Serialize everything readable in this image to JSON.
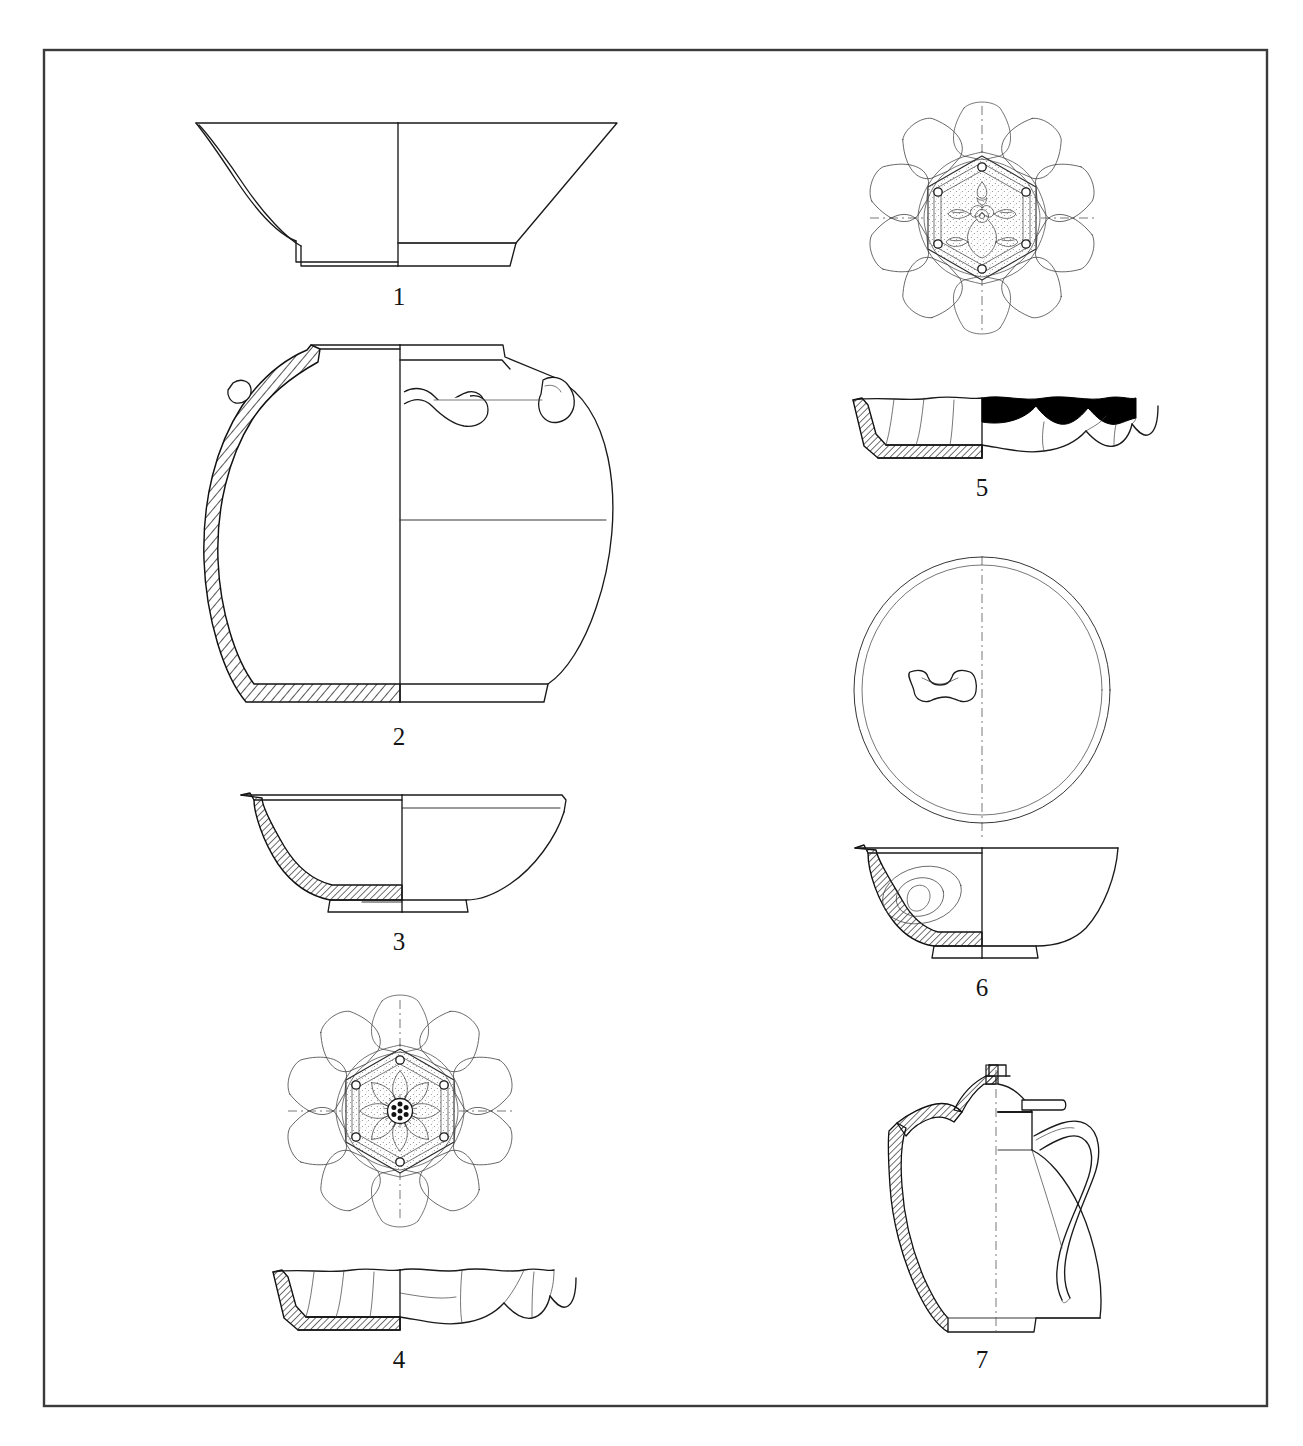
{
  "plate": {
    "type": "archaeological-vessel-illustration-plate",
    "description": "Line-drawing plate of seven ceramic vessels, each shown as a half-section (hatched, left) and half-elevation (outline, right); lobed dishes and one lid additionally shown in plan view above their profiles.",
    "border_color": "#3a3a3a",
    "background_color": "#ffffff",
    "ink_color": "#1a1a1a",
    "figure_count": 7
  },
  "figures": [
    {
      "number": "1",
      "name": "conical-bowl",
      "label": "1",
      "views": [
        "profile-section"
      ],
      "column": "left",
      "notes": "Deep conical bowl with flaring straight walls and a low ring foot; left half hatched in section."
    },
    {
      "number": "2",
      "name": "globular-jar-with-lugs",
      "label": "2",
      "views": [
        "profile-section"
      ],
      "column": "left",
      "notes": "Wide-mouthed globular jar with short everted rim and two loop lug handles on the shoulder."
    },
    {
      "number": "3",
      "name": "shallow-bowl",
      "label": "3",
      "views": [
        "profile-section"
      ],
      "column": "left",
      "notes": "Shallow rounded bowl with slightly everted rim and a low ring foot."
    },
    {
      "number": "4",
      "name": "lobed-lotus-dish-rosette",
      "label": "4",
      "views": [
        "plan",
        "profile-section"
      ],
      "column": "left",
      "notes": "Ten-lobed foliate dish; interior medallion of a hexagonal cartouche enclosing an eight-petal rosette with a seven-dot sunburst centre."
    },
    {
      "number": "5",
      "name": "lobed-lotus-dish-floral-spray",
      "label": "5",
      "views": [
        "plan",
        "profile-section"
      ],
      "column": "right",
      "notes": "Ten-lobed foliate dish; hexagonal cartouche enclosing a leafy floral spray with bud. Profile shows a solid black (dark glazed) band below the rim on the elevation half."
    },
    {
      "number": "6",
      "name": "bowl-with-lid",
      "label": "6",
      "views": [
        "plan",
        "profile-section"
      ],
      "column": "right",
      "notes": "Round lid in plan with a central spool-shaped lug; below, a hemispherical bowl with a ring foot and an oval medallion shown on the interior."
    },
    {
      "number": "7",
      "name": "lidded-ewer",
      "label": "7",
      "views": [
        "profile-section"
      ],
      "column": "right",
      "notes": "Pear-shaped ewer with a tall curving spout, domed lid with finial and lug, and a high strap handle."
    }
  ],
  "legend": {
    "section_hatching": "diagonal hatching = cut wall in section",
    "solid_black": "solid black = dark glaze / slip band",
    "stipple": "stipple = recessed decorated ground",
    "axis": "dash-dot line = vessel axis of symmetry"
  }
}
